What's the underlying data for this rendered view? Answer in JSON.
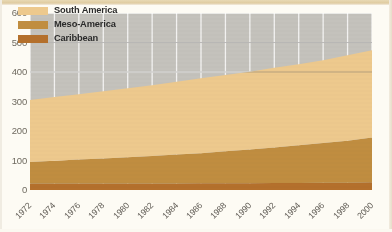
{
  "chart_data": {
    "type": "area",
    "stacked": true,
    "title": "",
    "subtitle": "",
    "xlabel": "",
    "ylabel": "",
    "xlim": [
      1972,
      2000
    ],
    "ylim": [
      0,
      600
    ],
    "grid": true,
    "legend_position": "top-left",
    "x": [
      1972,
      1974,
      1976,
      1978,
      1980,
      1982,
      1984,
      1986,
      1988,
      1990,
      1992,
      1994,
      1996,
      1998,
      2000
    ],
    "categories": [
      "1972",
      "1974",
      "1976",
      "1978",
      "1980",
      "1982",
      "1984",
      "1986",
      "1988",
      "1990",
      "1992",
      "1994",
      "1996",
      "1998",
      "2000"
    ],
    "series": [
      {
        "name": "Caribbean",
        "color": "#b4702c",
        "values": [
          22,
          22,
          22,
          22,
          22,
          22,
          22,
          23,
          23,
          23,
          24,
          24,
          25,
          25,
          26
        ]
      },
      {
        "name": "Meso-America",
        "color": "#c08d40",
        "values": [
          73,
          77,
          81,
          85,
          89,
          93,
          98,
          102,
          108,
          114,
          120,
          128,
          134,
          142,
          152
        ]
      },
      {
        "name": "South America",
        "color": "#edc98d",
        "values": [
          210,
          216,
          222,
          228,
          234,
          240,
          247,
          254,
          259,
          264,
          270,
          274,
          281,
          290,
          296
        ]
      }
    ],
    "stacked_totals": [
      305,
      315,
      325,
      335,
      345,
      355,
      367,
      379,
      390,
      401,
      414,
      426,
      440,
      457,
      474
    ],
    "cumulative_boundaries": {
      "caribbean_top": [
        22,
        22,
        22,
        22,
        22,
        22,
        22,
        23,
        23,
        23,
        24,
        24,
        25,
        25,
        26
      ],
      "meso_top": [
        95,
        99,
        103,
        107,
        111,
        115,
        120,
        125,
        131,
        137,
        144,
        152,
        159,
        167,
        178
      ],
      "south_top": [
        305,
        315,
        325,
        335,
        345,
        355,
        367,
        379,
        390,
        401,
        414,
        426,
        440,
        457,
        474
      ]
    },
    "yticks": [
      0,
      100,
      200,
      300,
      400,
      500,
      600
    ],
    "ytick_labels": [
      "0",
      "100",
      "200",
      "300",
      "400",
      "500",
      "600"
    ],
    "legend": [
      {
        "label": "South America",
        "color": "#edc98d",
        "swatch": "south-america-swatch"
      },
      {
        "label": "Meso-America",
        "color": "#c08d40",
        "swatch": "meso-america-swatch"
      },
      {
        "label": "Caribbean",
        "color": "#b4702c",
        "swatch": "caribbean-swatch"
      }
    ],
    "colors": {
      "panel_background": "#c4c2bc",
      "figure_background": "#fdfbf4",
      "gridline": "#ffffff",
      "axis_text": "#6f6a60",
      "legend_text": "#2b2b2b"
    }
  }
}
